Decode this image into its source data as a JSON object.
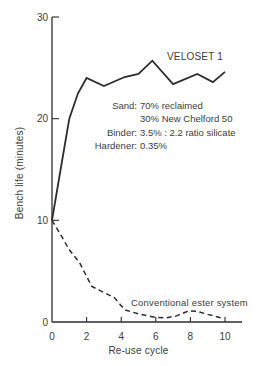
{
  "figure": {
    "background": "#ffffff",
    "line_color": "#2d2d2d",
    "text_color": "#3d3d3d"
  },
  "chart_data": {
    "type": "line",
    "title": "",
    "xlabel": "Re-use cycle",
    "ylabel": "Bench life (minutes)",
    "xlim": [
      0,
      10
    ],
    "ylim": [
      0,
      30
    ],
    "x_ticks": [
      0,
      2,
      4,
      6,
      8,
      10
    ],
    "y_ticks": [
      0,
      10,
      20,
      30
    ],
    "grid": false,
    "legend_position": "inline-labels",
    "series": [
      {
        "name": "VELOSET 1",
        "line_style": "solid",
        "color": "#2d2d2d",
        "points": [
          [
            0,
            10
          ],
          [
            0.5,
            15
          ],
          [
            1,
            20
          ],
          [
            1.5,
            22.5
          ],
          [
            2,
            24
          ],
          [
            3,
            23.2
          ],
          [
            4.2,
            24.1
          ],
          [
            5,
            24.4
          ],
          [
            5.8,
            25.7
          ],
          [
            7,
            23.4
          ],
          [
            8.4,
            24.4
          ],
          [
            9.3,
            23.6
          ],
          [
            10,
            24.6
          ]
        ]
      },
      {
        "name": "Conventional ester system",
        "line_style": "dashed",
        "color": "#2d2d2d",
        "points": [
          [
            0,
            10
          ],
          [
            0.5,
            8.6
          ],
          [
            1,
            7.1
          ],
          [
            1.6,
            5.8
          ],
          [
            2.3,
            3.5
          ],
          [
            3,
            2.9
          ],
          [
            3.6,
            2.4
          ],
          [
            4.2,
            1.2
          ],
          [
            5,
            0.8
          ],
          [
            6,
            0.45
          ],
          [
            6.6,
            0.4
          ],
          [
            7.2,
            0.6
          ],
          [
            7.9,
            1.1
          ],
          [
            8.4,
            1.05
          ],
          [
            9,
            0.75
          ],
          [
            9.8,
            0.4
          ]
        ]
      }
    ],
    "note": {
      "rows": [
        {
          "label": "Sand:",
          "value": "70% reclaimed"
        },
        {
          "label": "",
          "value": "30% New Chelford 50"
        },
        {
          "label": "Binder:",
          "value": "3.5% : 2.2 ratio silicate"
        },
        {
          "label": "Hardener:",
          "value": "0.35%"
        }
      ]
    }
  }
}
